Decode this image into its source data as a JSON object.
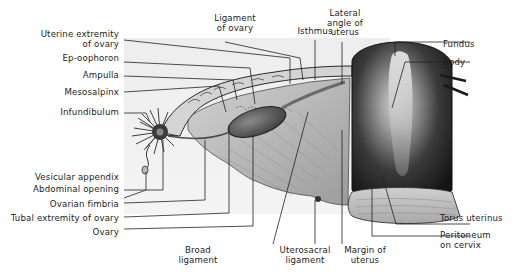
{
  "figure": {
    "labels_left": [
      {
        "id": "uterine-extremity-of-ovary",
        "line1": "Uterine extremity",
        "line2": "of ovary"
      },
      {
        "id": "ep-oophoron",
        "line1": "Ep-oophoron"
      },
      {
        "id": "ampulla",
        "line1": "Ampulla"
      },
      {
        "id": "mesosalpinx",
        "line1": "Mesosalpinx"
      },
      {
        "id": "infundibulum",
        "line1": "Infundibulum"
      },
      {
        "id": "vesicular-appendix",
        "line1": "Vesicular appendix"
      },
      {
        "id": "abdominal-opening",
        "line1": "Abdominal opening"
      },
      {
        "id": "ovarian-fimbria",
        "line1": "Ovarian fimbria"
      },
      {
        "id": "tubal-extremity-of-ovary",
        "line1": "Tubal extremity of ovary"
      },
      {
        "id": "ovary",
        "line1": "Ovary"
      }
    ],
    "labels_top": [
      {
        "id": "ligament-of-ovary",
        "line1": "Ligament",
        "line2": "of ovary"
      },
      {
        "id": "isthmus",
        "line1": "Isthmus"
      },
      {
        "id": "lateral-angle-of-uterus",
        "line1": "Lateral",
        "line2": "angle of",
        "line3": "uterus"
      }
    ],
    "labels_right": [
      {
        "id": "fundus",
        "line1": "Fundus"
      },
      {
        "id": "body",
        "line1": "Body"
      },
      {
        "id": "torus-uterinus",
        "line1": "Torus uterinus"
      },
      {
        "id": "peritoneum-on-cervix",
        "line1": "Peritoneum",
        "line2": "on cervix"
      }
    ],
    "labels_bottom": [
      {
        "id": "broad-ligament",
        "line1": "Broad",
        "line2": "ligament"
      },
      {
        "id": "uterosacral-ligament",
        "line1": "Uterosacral",
        "line2": "ligament"
      },
      {
        "id": "margin-of-uterus",
        "line1": "Margin of",
        "line2": "uterus"
      }
    ]
  }
}
